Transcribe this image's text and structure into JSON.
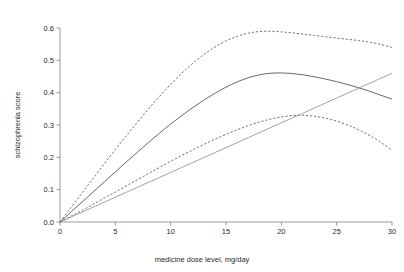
{
  "chart_data": {
    "type": "line",
    "title": "",
    "xlabel": "medicine dose level, mg/day",
    "ylabel": "schizophrenia score",
    "xlim": [
      0,
      30
    ],
    "ylim": [
      0.0,
      0.6
    ],
    "xticks": [
      0,
      5,
      10,
      15,
      20,
      25,
      30
    ],
    "xticklabels": [
      "0",
      "5",
      "10",
      "15",
      "20",
      "25",
      "30"
    ],
    "yticks": [
      0.0,
      0.1,
      0.2,
      0.3,
      0.4,
      0.5,
      0.6
    ],
    "yticklabels": [
      "0.0",
      "0.1",
      "0.2",
      "0.3",
      "0.4",
      "0.5",
      "0.6"
    ],
    "grid": false,
    "legend": "none",
    "background": "#ffffff",
    "x": [
      0,
      1,
      2,
      3,
      4,
      5,
      6,
      7,
      8,
      9,
      10,
      11,
      12,
      13,
      14,
      15,
      16,
      17,
      18,
      19,
      20,
      21,
      22,
      23,
      24,
      25,
      26,
      27,
      28,
      29,
      30
    ],
    "series": [
      {
        "name": "upper confidence band",
        "style": "dashed",
        "color": "#4d4d4d",
        "values": [
          0.0,
          0.045,
          0.09,
          0.135,
          0.18,
          0.224,
          0.267,
          0.309,
          0.35,
          0.389,
          0.426,
          0.46,
          0.491,
          0.518,
          0.541,
          0.56,
          0.574,
          0.584,
          0.589,
          0.59,
          0.588,
          0.585,
          0.581,
          0.577,
          0.573,
          0.569,
          0.565,
          0.561,
          0.556,
          0.549,
          0.54
        ]
      },
      {
        "name": "fitted estimate",
        "style": "solid",
        "color": "#4d4d4d",
        "values": [
          0.0,
          0.031,
          0.062,
          0.093,
          0.124,
          0.155,
          0.186,
          0.216,
          0.246,
          0.275,
          0.303,
          0.329,
          0.354,
          0.377,
          0.398,
          0.417,
          0.433,
          0.446,
          0.455,
          0.46,
          0.461,
          0.459,
          0.455,
          0.449,
          0.442,
          0.434,
          0.425,
          0.415,
          0.404,
          0.392,
          0.38
        ]
      },
      {
        "name": "lower confidence band",
        "style": "dashed",
        "color": "#4d4d4d",
        "values": [
          0.0,
          0.018,
          0.036,
          0.055,
          0.074,
          0.093,
          0.112,
          0.131,
          0.15,
          0.169,
          0.188,
          0.206,
          0.223,
          0.24,
          0.256,
          0.271,
          0.285,
          0.298,
          0.309,
          0.318,
          0.325,
          0.329,
          0.33,
          0.327,
          0.321,
          0.312,
          0.3,
          0.285,
          0.267,
          0.246,
          0.222
        ]
      },
      {
        "name": "linear reference",
        "style": "solid-light",
        "color": "#8a8a8a",
        "values": [
          0.0,
          0.0153,
          0.0307,
          0.046,
          0.0613,
          0.0767,
          0.092,
          0.1073,
          0.1227,
          0.138,
          0.1533,
          0.1687,
          0.184,
          0.1993,
          0.2147,
          0.23,
          0.2453,
          0.2607,
          0.276,
          0.2913,
          0.3067,
          0.322,
          0.3373,
          0.3527,
          0.368,
          0.3833,
          0.3987,
          0.414,
          0.4293,
          0.4447,
          0.46
        ]
      }
    ]
  }
}
